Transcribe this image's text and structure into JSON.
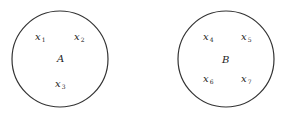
{
  "sets": [
    {
      "name": "A",
      "cx": 60,
      "cy": 59,
      "r": 48,
      "label_pos": [
        57,
        62
      ],
      "elements": [
        {
          "base": "x",
          "sub": "1",
          "pos": [
            35,
            40
          ]
        },
        {
          "base": "x",
          "sub": "2",
          "pos": [
            74,
            40
          ]
        },
        {
          "base": "x",
          "sub": "3",
          "pos": [
            55,
            87
          ]
        }
      ]
    },
    {
      "name": "B",
      "cx": 226,
      "cy": 59,
      "r": 48,
      "label_pos": [
        222,
        63
      ],
      "elements": [
        {
          "base": "x",
          "sub": "4",
          "pos": [
            203,
            40
          ]
        },
        {
          "base": "x",
          "sub": "5",
          "pos": [
            241,
            40
          ]
        },
        {
          "base": "x",
          "sub": "6",
          "pos": [
            203,
            82
          ]
        },
        {
          "base": "x",
          "sub": "7",
          "pos": [
            241,
            82
          ]
        }
      ]
    }
  ],
  "colors": {
    "stroke": "#333333",
    "background": "#ffffff"
  }
}
